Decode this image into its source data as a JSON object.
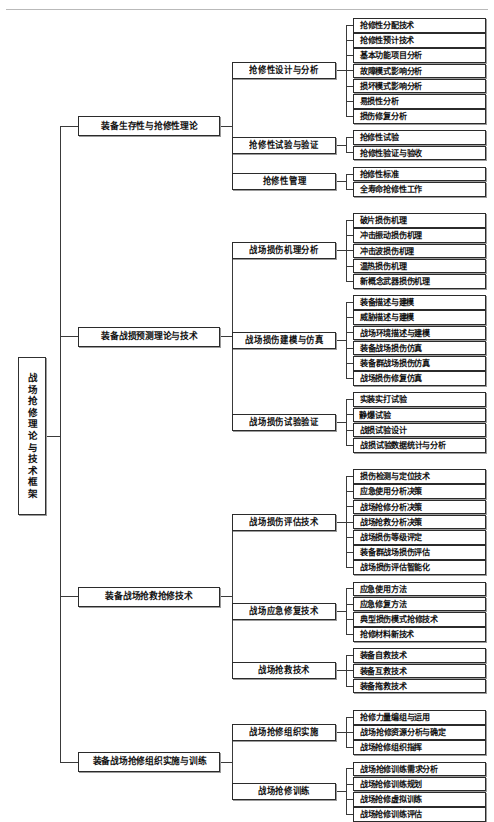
{
  "diagram": {
    "type": "organization-tree",
    "orientation": "left-to-right",
    "root": {
      "label": "战场抢修理论与技术框架",
      "orientation": "vertical"
    },
    "branches": [
      {
        "label": "装备生存性与抢修性理论",
        "children": [
          {
            "label": "抢修性设计与分析",
            "leaves": [
              "抢修性分配技术",
              "抢修性预计技术",
              "基本功能项目分析",
              "故障模式影响分析",
              "损坏模式影响分析",
              "易损性分析",
              "损伤修复分析"
            ]
          },
          {
            "label": "抢修性试验与验证",
            "leaves": [
              "抢修性试验",
              "抢修性验证与验收"
            ]
          },
          {
            "label": "抢修性管理",
            "leaves": [
              "抢修性标准",
              "全寿命抢修性工作"
            ]
          }
        ]
      },
      {
        "label": "装备战损预测理论与技术",
        "children": [
          {
            "label": "战场损伤机理分析",
            "leaves": [
              "破片损伤机理",
              "冲击振动损伤机理",
              "冲击波损伤机理",
              "温热损伤机理",
              "新概念武器损伤机理"
            ]
          },
          {
            "label": "战场损伤建模与仿真",
            "leaves": [
              "装备描述与建模",
              "威胁描述与建模",
              "战场环境描述与建模",
              "装备战场损伤仿真",
              "装备群战场损伤仿真",
              "战场损伤修复仿真"
            ]
          },
          {
            "label": "战场损伤试验验证",
            "leaves": [
              "实装实打试验",
              "静爆试验",
              "战损试验设计",
              "战损试验数据统计与分析"
            ]
          }
        ]
      },
      {
        "label": "装备战场抢救抢修技术",
        "children": [
          {
            "label": "战场损伤评估技术",
            "leaves": [
              "损伤检测与定位技术",
              "应急使用分析决策",
              "战场抢修分析决策",
              "战场抢救分析决策",
              "战场损伤等级评定",
              "装备群战场损伤评估",
              "战场损伤评估智能化"
            ]
          },
          {
            "label": "战场应急修复技术",
            "leaves": [
              "应急使用方法",
              "应急修复方法",
              "典型损伤模式抢修技术",
              "抢修材料新技术"
            ]
          },
          {
            "label": "战场抢救技术",
            "leaves": [
              "装备自救技术",
              "装备互救技术",
              "装备拖救技术"
            ]
          }
        ]
      },
      {
        "label": "装备战场抢修组织实施与训练",
        "children": [
          {
            "label": "战场抢修组织实施",
            "leaves": [
              "抢修力量编组与运用",
              "战场抢修资源分析与确定",
              "战场抢修组织指挥"
            ]
          },
          {
            "label": "战场抢修训练",
            "leaves": [
              "战场抢修训练需求分析",
              "战场抢修训练规划",
              "战场抢修虚拟训练",
              "战场抢修训练评估"
            ]
          }
        ]
      }
    ]
  },
  "style": {
    "box_border": "#2b2b2b",
    "line_color": "#3a3a3a",
    "background": "#ffffff",
    "text_color": "#111111"
  }
}
